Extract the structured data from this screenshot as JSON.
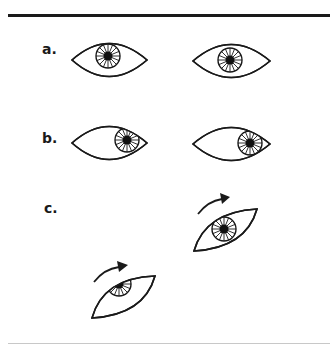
{
  "figure": {
    "colors": {
      "ink": "#1a1a1a",
      "background": "#ffffff",
      "bottom_rule": "#c8c8c8"
    },
    "panels": [
      {
        "id": "a",
        "label": "a.",
        "description": "Both eyes looking straight ahead, irises centered"
      },
      {
        "id": "b",
        "label": "b.",
        "description": "Both eyes looking to the right, irises shifted right"
      },
      {
        "id": "c",
        "label": "c.",
        "description": "Eyes rotated with curved arrows indicating rotation direction"
      }
    ]
  }
}
